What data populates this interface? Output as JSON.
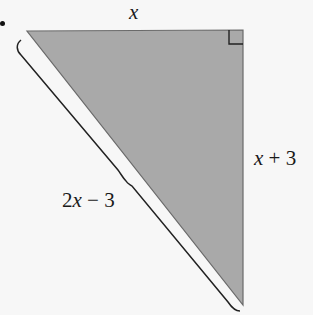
{
  "figure": {
    "type": "right-triangle",
    "colors": {
      "fill": "#a9a9a9",
      "stroke": "#555555",
      "brace": "#222222",
      "background": "#f7f7f7"
    },
    "vertices": {
      "top_left": [
        27,
        31
      ],
      "top_right": [
        243,
        30
      ],
      "bottom": [
        243,
        305
      ]
    },
    "right_angle_marker": "top-right",
    "labels": {
      "top_side": "x",
      "right_side": "x + 3",
      "hypotenuse": "2x − 3"
    }
  }
}
